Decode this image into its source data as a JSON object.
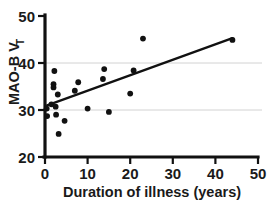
{
  "chart_data": {
    "type": "scatter",
    "title": "",
    "xlabel": "Duration of illness (years)",
    "ylabel": "MAO-B V",
    "ylabel_subscript": "T",
    "xlim": [
      0,
      50
    ],
    "ylim": [
      20,
      50
    ],
    "xticks": [
      0,
      10,
      20,
      30,
      40,
      50
    ],
    "yticks": [
      20,
      30,
      40,
      50
    ],
    "xtick_labels": [
      "0",
      "10",
      "20",
      "30",
      "40",
      "50"
    ],
    "ytick_labels": [
      "20",
      "30",
      "40",
      "50"
    ],
    "grid": true,
    "gridlines_y": [
      30,
      40
    ],
    "legend": "none",
    "point_color": "#111111",
    "line_color": "#111111",
    "grid_color": "#d2d2d2",
    "axis_color": "#111111",
    "points": [
      {
        "x": 0.4,
        "y": 30.3
      },
      {
        "x": 0.5,
        "y": 28.7
      },
      {
        "x": 1.5,
        "y": 31.2
      },
      {
        "x": 2.0,
        "y": 35.5
      },
      {
        "x": 2.0,
        "y": 34.8
      },
      {
        "x": 2.2,
        "y": 38.3
      },
      {
        "x": 2.5,
        "y": 30.7
      },
      {
        "x": 2.6,
        "y": 29.0
      },
      {
        "x": 3.0,
        "y": 33.3
      },
      {
        "x": 3.2,
        "y": 24.9
      },
      {
        "x": 4.6,
        "y": 27.7
      },
      {
        "x": 7.0,
        "y": 34.1
      },
      {
        "x": 7.8,
        "y": 35.9
      },
      {
        "x": 10.0,
        "y": 30.3
      },
      {
        "x": 13.6,
        "y": 36.6
      },
      {
        "x": 13.9,
        "y": 38.7
      },
      {
        "x": 15.0,
        "y": 29.6
      },
      {
        "x": 20.0,
        "y": 33.5
      },
      {
        "x": 20.8,
        "y": 38.4
      },
      {
        "x": 23.0,
        "y": 45.2
      },
      {
        "x": 44.0,
        "y": 44.9
      }
    ],
    "fit_line": {
      "x0": 0.5,
      "y0": 31.0,
      "x1": 44.0,
      "y1": 45.3
    }
  }
}
